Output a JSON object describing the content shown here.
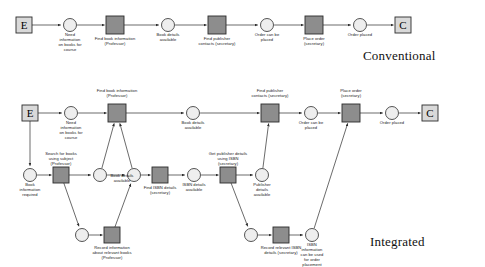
{
  "figure": {
    "type": "petri-net",
    "captions": [
      {
        "id": "conventional",
        "text": "Conventional",
        "x": 363,
        "y": 57
      },
      {
        "id": "integrated",
        "text": "Integrated",
        "x": 370,
        "y": 243
      }
    ]
  },
  "colors": {
    "transition_fill": "#8d8d8d",
    "transition_stroke": "#2b2b2b",
    "place_fill": "#eeeeee",
    "place_stroke": "#2b2b2b",
    "terminal_fill": "#d9d9d9",
    "terminal_stroke": "#2b2b2b",
    "arc_stroke": "#2b2b2b",
    "background": "#ffffff",
    "text": "#1a1a1a"
  },
  "conventional": {
    "name": "Conventional process",
    "nodes": [
      {
        "id": "c-start",
        "kind": "terminal",
        "glyph": "E",
        "label": "",
        "x": 24,
        "y": 25,
        "w": 16,
        "h": 16
      },
      {
        "id": "c-p1",
        "kind": "place",
        "label": "Need\ninformation\non books for\ncourse",
        "x": 70,
        "y": 25,
        "r": 6.5,
        "label_y": 32
      },
      {
        "id": "c-t1",
        "kind": "transition",
        "label": "Find book information\n(Professor)",
        "x": 115,
        "y": 25,
        "w": 18,
        "h": 18,
        "label_y": 36
      },
      {
        "id": "c-p2",
        "kind": "place",
        "label": "Book details\navailable",
        "x": 168,
        "y": 25,
        "r": 6.5,
        "label_y": 32
      },
      {
        "id": "c-t2",
        "kind": "transition",
        "label": "Find publisher\ncontacts (secretary)",
        "x": 217,
        "y": 25,
        "w": 18,
        "h": 18,
        "label_y": 36
      },
      {
        "id": "c-p3",
        "kind": "place",
        "label": "Order can be\nplaced",
        "x": 267,
        "y": 25,
        "r": 6.5,
        "label_y": 32
      },
      {
        "id": "c-t3",
        "kind": "transition",
        "label": "Place order\n(secretary)",
        "x": 314,
        "y": 25,
        "w": 18,
        "h": 18,
        "label_y": 36
      },
      {
        "id": "c-p4",
        "kind": "place",
        "label": "Order placed",
        "x": 360,
        "y": 25,
        "r": 6.5,
        "label_y": 32
      },
      {
        "id": "c-end",
        "kind": "terminal",
        "glyph": "C",
        "label": "",
        "x": 403,
        "y": 25,
        "w": 16,
        "h": 16
      }
    ],
    "arcs": [
      {
        "from": "c-start",
        "to": "c-p1"
      },
      {
        "from": "c-p1",
        "to": "c-t1"
      },
      {
        "from": "c-t1",
        "to": "c-p2"
      },
      {
        "from": "c-p2",
        "to": "c-t2"
      },
      {
        "from": "c-t2",
        "to": "c-p3"
      },
      {
        "from": "c-p3",
        "to": "c-t3"
      },
      {
        "from": "c-t3",
        "to": "c-p4"
      },
      {
        "from": "c-p4",
        "to": "c-end"
      }
    ]
  },
  "integrated": {
    "name": "Integrated process",
    "nodes": [
      {
        "id": "i-start",
        "kind": "terminal",
        "glyph": "E",
        "label": "",
        "x": 30,
        "y": 113,
        "w": 16,
        "h": 16
      },
      {
        "id": "i-p1",
        "kind": "place",
        "label": "Need\ninformation\non books for\ncourse",
        "x": 71,
        "y": 113,
        "r": 6.5,
        "label_y": 120
      },
      {
        "id": "i-t1",
        "kind": "transition",
        "label": "Find book information\n(Professor)",
        "x": 117,
        "y": 113,
        "w": 18,
        "h": 18,
        "label_y": 88,
        "label_above": true
      },
      {
        "id": "i-p2",
        "kind": "place",
        "label": "Book details\navailable",
        "x": 193,
        "y": 113,
        "r": 6.5,
        "label_y": 120
      },
      {
        "id": "i-t2",
        "kind": "transition",
        "label": "Find publisher\ncontacts (secretary)",
        "x": 270,
        "y": 113,
        "w": 18,
        "h": 18,
        "label_y": 88,
        "label_above": true
      },
      {
        "id": "i-p3",
        "kind": "place",
        "label": "Order can be\nplaced",
        "x": 311,
        "y": 113,
        "r": 6.5,
        "label_y": 120
      },
      {
        "id": "i-t3",
        "kind": "transition",
        "label": "Place order\n(secretary)",
        "x": 351,
        "y": 113,
        "w": 18,
        "h": 18,
        "label_y": 88,
        "label_above": true
      },
      {
        "id": "i-p4",
        "kind": "place",
        "label": "Order placed",
        "x": 392,
        "y": 113,
        "r": 6.5,
        "label_y": 120
      },
      {
        "id": "i-end",
        "kind": "terminal",
        "glyph": "C",
        "label": "",
        "x": 430,
        "y": 113,
        "w": 16,
        "h": 16
      },
      {
        "id": "i-p5",
        "kind": "place",
        "label": "Book\ninformation\nrequired",
        "x": 30,
        "y": 175,
        "r": 6.5,
        "label_y": 182
      },
      {
        "id": "i-t4",
        "kind": "transition",
        "label": "Search for books\nusing subject\n(Professor)",
        "x": 61,
        "y": 175,
        "w": 16,
        "h": 16,
        "label_y": 151,
        "label_above": true
      },
      {
        "id": "i-p6",
        "kind": "place",
        "label": "Book details\navailable",
        "x": 100,
        "y": 175,
        "r": 6.5,
        "label_y": 173,
        "label_shift": 22
      },
      {
        "id": "i-p7",
        "kind": "place",
        "label": "",
        "x": 134,
        "y": 175,
        "r": 6.5
      },
      {
        "id": "i-t5",
        "kind": "transition",
        "label": "Find ISBN details\n(secretary)",
        "x": 160,
        "y": 175,
        "w": 16,
        "h": 16,
        "label_y": 185
      },
      {
        "id": "i-p8",
        "kind": "place",
        "label": "ISBN details\navailable",
        "x": 194,
        "y": 175,
        "r": 6.5,
        "label_y": 182
      },
      {
        "id": "i-t6",
        "kind": "transition",
        "label": "Get publisher details\nusing ISBN\n(secretary)",
        "x": 228,
        "y": 175,
        "w": 16,
        "h": 16,
        "label_y": 151,
        "label_above": true
      },
      {
        "id": "i-p9",
        "kind": "place",
        "label": "Publisher\ndetails\navailable",
        "x": 262,
        "y": 175,
        "r": 6.5,
        "label_y": 182
      },
      {
        "id": "i-p10",
        "kind": "place",
        "label": "",
        "x": 82,
        "y": 235,
        "r": 6.5
      },
      {
        "id": "i-t7",
        "kind": "transition",
        "label": "Record information\nabout relevant books\n(Professor)",
        "x": 112,
        "y": 235,
        "w": 16,
        "h": 16,
        "label_y": 245
      },
      {
        "id": "i-p11",
        "kind": "place",
        "label": "",
        "x": 251,
        "y": 235,
        "r": 6.5
      },
      {
        "id": "i-t8",
        "kind": "transition",
        "label": "Record relevant ISBN\ndetails (secretary)",
        "x": 281,
        "y": 235,
        "w": 16,
        "h": 16,
        "label_y": 245
      },
      {
        "id": "i-p12",
        "kind": "place",
        "label": "ISBN\ninformation\ncan be used\nfor order\nplacement",
        "x": 312,
        "y": 235,
        "r": 6.5,
        "label_y": 242
      }
    ],
    "arcs": [
      {
        "from": "i-start",
        "to": "i-p1"
      },
      {
        "from": "i-p1",
        "to": "i-t1"
      },
      {
        "from": "i-t1",
        "to": "i-p2"
      },
      {
        "from": "i-p2",
        "to": "i-t2"
      },
      {
        "from": "i-t2",
        "to": "i-p3"
      },
      {
        "from": "i-p3",
        "to": "i-t3"
      },
      {
        "from": "i-t3",
        "to": "i-p4"
      },
      {
        "from": "i-p4",
        "to": "i-end"
      },
      {
        "from": "i-start",
        "to": "i-p5"
      },
      {
        "from": "i-p5",
        "to": "i-t4"
      },
      {
        "from": "i-t4",
        "to": "i-p6"
      },
      {
        "from": "i-t4",
        "to": "i-p10"
      },
      {
        "from": "i-p6",
        "to": "i-t1"
      },
      {
        "from": "i-p7",
        "to": "i-t1"
      },
      {
        "from": "i-p6",
        "to": "i-p7"
      },
      {
        "from": "i-p10",
        "to": "i-t7"
      },
      {
        "from": "i-t7",
        "to": "i-p7"
      },
      {
        "from": "i-p7",
        "to": "i-t5"
      },
      {
        "from": "i-t5",
        "to": "i-p8"
      },
      {
        "from": "i-p8",
        "to": "i-t6"
      },
      {
        "from": "i-t6",
        "to": "i-p9"
      },
      {
        "from": "i-t6",
        "to": "i-p11"
      },
      {
        "from": "i-p9",
        "to": "i-t2"
      },
      {
        "from": "i-p11",
        "to": "i-t8"
      },
      {
        "from": "i-t8",
        "to": "i-p12"
      },
      {
        "from": "i-p12",
        "to": "i-t3"
      }
    ]
  }
}
